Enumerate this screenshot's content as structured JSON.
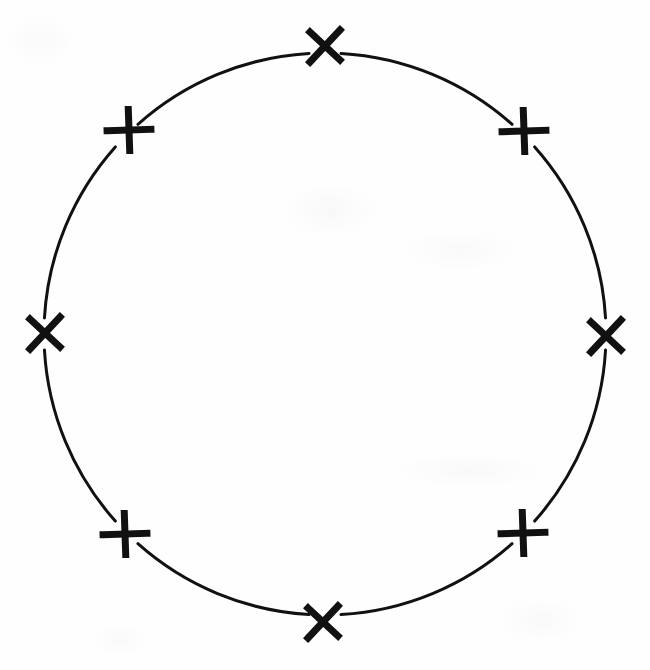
{
  "figure": {
    "background_color": "#fefefe",
    "ink_color": "#111111",
    "caption": ""
  },
  "chart_data": {
    "type": "scatter",
    "subtitle": "",
    "xlabel": "",
    "ylabel": "",
    "grid": false,
    "legend": null,
    "xlim": [
      0,
      650
    ],
    "ylim": [
      0,
      670
    ],
    "circle": {
      "center_x": 325,
      "center_y": 334,
      "radius": 281,
      "stroke_width": 3,
      "stroke_color": "#111111",
      "fill": "none"
    },
    "marker_symbol": "X",
    "marker_count": 8,
    "angular_spacing_degrees": 45,
    "categories": [
      "top",
      "upper-right",
      "right",
      "lower-right",
      "bottom",
      "lower-left",
      "left",
      "upper-left"
    ],
    "points": [
      {
        "label": "top",
        "angle_deg": 90,
        "x": 325,
        "y": 46,
        "rotation_deg": 0,
        "size": 30
      },
      {
        "label": "upper-right",
        "angle_deg": 45,
        "x": 524,
        "y": 131,
        "rotation_deg": 45,
        "size": 30
      },
      {
        "label": "right",
        "angle_deg": 0,
        "x": 606,
        "y": 336,
        "rotation_deg": 0,
        "size": 30
      },
      {
        "label": "lower-right",
        "angle_deg": 315,
        "x": 523,
        "y": 533,
        "rotation_deg": 45,
        "size": 30
      },
      {
        "label": "bottom",
        "angle_deg": 270,
        "x": 323,
        "y": 622,
        "rotation_deg": 0,
        "size": 30
      },
      {
        "label": "lower-left",
        "angle_deg": 225,
        "x": 125,
        "y": 534,
        "rotation_deg": 45,
        "size": 30
      },
      {
        "label": "left",
        "angle_deg": 180,
        "x": 45,
        "y": 333,
        "rotation_deg": 0,
        "size": 30
      },
      {
        "label": "upper-left",
        "angle_deg": 135,
        "x": 129,
        "y": 130,
        "rotation_deg": 45,
        "size": 30
      }
    ],
    "arcs": [
      {
        "from": "top",
        "to": "upper-right"
      },
      {
        "from": "upper-right",
        "to": "right"
      },
      {
        "from": "right",
        "to": "lower-right"
      },
      {
        "from": "lower-right",
        "to": "bottom"
      },
      {
        "from": "bottom",
        "to": "lower-left"
      },
      {
        "from": "lower-left",
        "to": "left"
      },
      {
        "from": "left",
        "to": "upper-left"
      },
      {
        "from": "upper-left",
        "to": "top"
      }
    ]
  }
}
